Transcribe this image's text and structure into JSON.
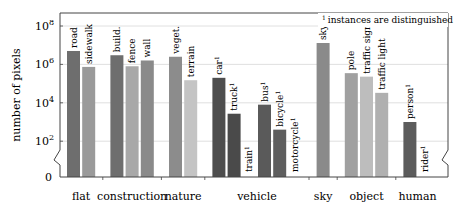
{
  "chart_data": {
    "type": "bar",
    "title": "",
    "xlabel": "",
    "ylabel": "number of pixels",
    "yscale": "log",
    "ylim": [
      0,
      100000000
    ],
    "yticks": [
      "0",
      "10^2",
      "10^4",
      "10^6",
      "10^8"
    ],
    "grid": true,
    "annotation": "1 instances are distinguished",
    "groups": [
      {
        "name": "flat",
        "bars": [
          {
            "label": "road",
            "value": 5000000,
            "instance": false,
            "color": "#6e6e6e"
          },
          {
            "label": "sidewalk",
            "value": 740000,
            "instance": false,
            "color": "#9a9a9a"
          }
        ]
      },
      {
        "name": "construction",
        "bars": [
          {
            "label": "build.",
            "value": 3000000,
            "instance": false,
            "color": "#6e6e6e"
          },
          {
            "label": "fence",
            "value": 800000,
            "instance": false,
            "color": "#a8a8a8"
          },
          {
            "label": "wall",
            "value": 1600000,
            "instance": false,
            "color": "#8a8a8a"
          }
        ]
      },
      {
        "name": "nature",
        "bars": [
          {
            "label": "veget.",
            "value": 2500000,
            "instance": false,
            "color": "#8c8c8c"
          },
          {
            "label": "terrain",
            "value": 150000,
            "instance": false,
            "color": "#c4c4c4"
          }
        ]
      },
      {
        "name": "vehicle",
        "bars": [
          {
            "label": "car",
            "value": 200000,
            "instance": true,
            "color": "#4e4e4e"
          },
          {
            "label": "truck",
            "value": 2700,
            "instance": true,
            "color": "#4a4a4a"
          },
          {
            "label": "train",
            "value": 0,
            "instance": true,
            "color": "#4a4a4a"
          },
          {
            "label": "bus",
            "value": 8000,
            "instance": true,
            "color": "#5a5a5a"
          },
          {
            "label": "bicycle",
            "value": 400,
            "instance": true,
            "color": "#5e5e5e"
          },
          {
            "label": "motorcycle",
            "value": 0,
            "instance": true,
            "color": "#5e5e5e"
          }
        ]
      },
      {
        "name": "sky",
        "bars": [
          {
            "label": "sky",
            "value": 13000000,
            "instance": false,
            "color": "#8a8a8a"
          }
        ]
      },
      {
        "name": "object",
        "bars": [
          {
            "label": "pole",
            "value": 350000,
            "instance": false,
            "color": "#a0a0a0"
          },
          {
            "label": "traffic sign",
            "value": 230000,
            "instance": false,
            "color": "#bdbdbd"
          },
          {
            "label": "traffic light",
            "value": 33000,
            "instance": false,
            "color": "#b0b0b0"
          }
        ]
      },
      {
        "name": "human",
        "bars": [
          {
            "label": "person",
            "value": 1000,
            "instance": true,
            "color": "#5c5c5c"
          },
          {
            "label": "rider",
            "value": 0,
            "instance": true,
            "color": "#5c5c5c"
          }
        ]
      }
    ]
  }
}
